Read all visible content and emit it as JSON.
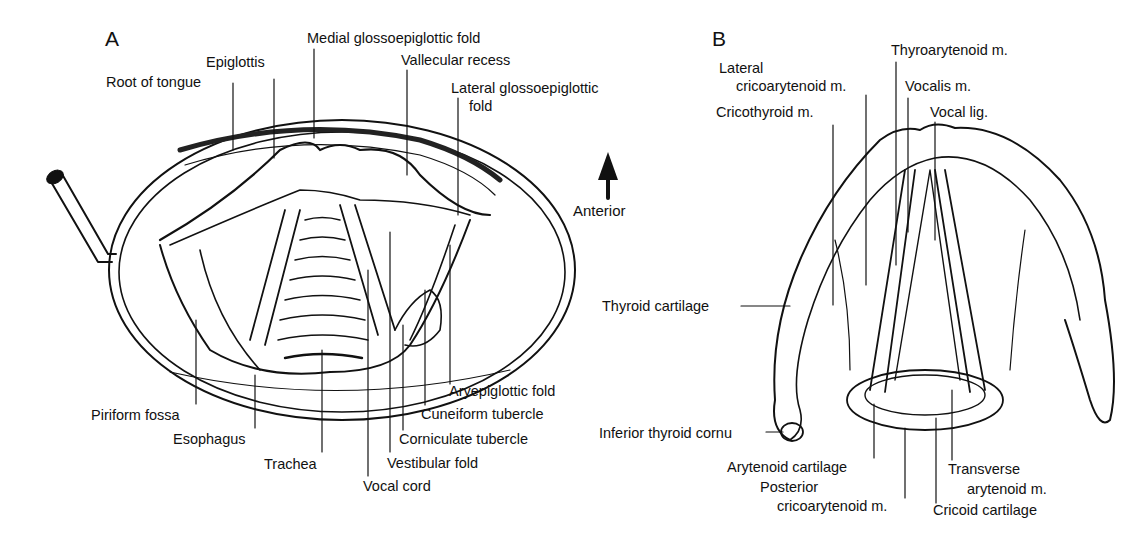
{
  "figure": {
    "panel_a": {
      "letter": "A",
      "labels": {
        "medial_glossoepiglottic_fold": "Medial glossoepiglottic fold",
        "epiglottis": "Epiglottis",
        "vallecular_recess": "Vallecular recess",
        "root_of_tongue": "Root of tongue",
        "lateral_glossoepiglottic_fold_1": "Lateral glossoepiglottic",
        "lateral_glossoepiglottic_fold_2": "fold",
        "aryepiglottic_fold": "Aryepiglottic fold",
        "cuneiform_tubercle": "Cuneiform tubercle",
        "corniculate_tubercle": "Corniculate tubercle",
        "vestibular_fold": "Vestibular fold",
        "vocal_cord": "Vocal cord",
        "trachea": "Trachea",
        "esophagus": "Esophagus",
        "piriform_fossa": "Piriform fossa"
      }
    },
    "orientation": {
      "label": "Anterior",
      "icon": "arrow-up-icon"
    },
    "panel_b": {
      "letter": "B",
      "labels": {
        "thyroarytenoid_m": "Thyroarytenoid m.",
        "lateral_cricoarytenoid_1": "Lateral",
        "lateral_cricoarytenoid_2": "cricoarytenoid m.",
        "vocalis_m": "Vocalis m.",
        "cricothyroid_m": "Cricothyroid m.",
        "vocal_lig": "Vocal lig.",
        "thyroid_cartilage": "Thyroid cartilage",
        "inferior_thyroid_cornu": "Inferior thyroid cornu",
        "arytenoid_cartilage": "Arytenoid cartilage",
        "posterior_cricoarytenoid_1": "Posterior",
        "posterior_cricoarytenoid_2": "cricoarytenoid m.",
        "transverse_arytenoid_1": "Transverse",
        "transverse_arytenoid_2": "arytenoid m.",
        "cricoid_cartilage": "Cricoid cartilage"
      }
    }
  }
}
